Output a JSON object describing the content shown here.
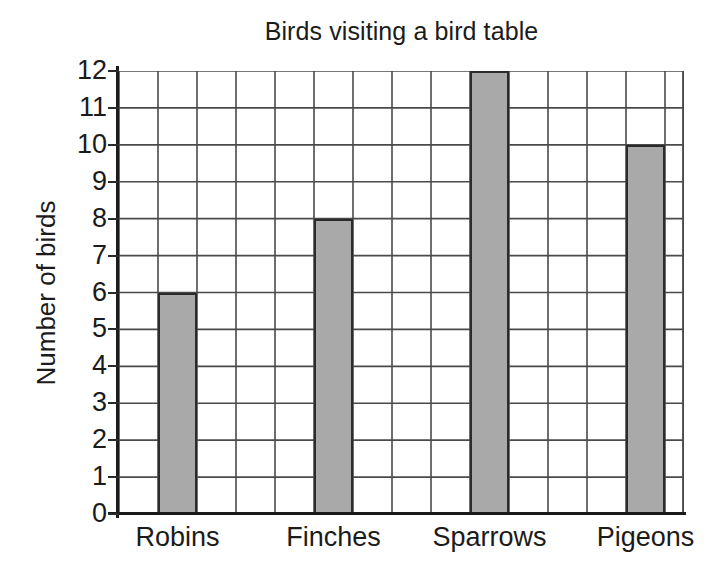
{
  "chart_data": {
    "type": "bar",
    "title": "Birds visiting a bird table",
    "xlabel": "",
    "ylabel": "Number of birds",
    "categories": [
      "Robins",
      "Finches",
      "Sparrows",
      "Pigeons"
    ],
    "values": [
      6,
      8,
      12,
      10
    ],
    "ylim": [
      0,
      12
    ],
    "ytick_labels": [
      "0",
      "1",
      "2",
      "3",
      "4",
      "5",
      "6",
      "7",
      "8",
      "9",
      "10",
      "11",
      "12"
    ],
    "ytick_values": [
      0,
      1,
      2,
      3,
      4,
      5,
      6,
      7,
      8,
      9,
      10,
      11,
      12
    ],
    "grid": true,
    "grid_columns": 14,
    "legend": null,
    "bar_fill_color": "#a9a9a9",
    "bar_edge_color": "#2b2b2b",
    "grid_line_color": "#4a4a4a",
    "axis_color": "#1b1b1b",
    "background_color": "#ffffff"
  }
}
